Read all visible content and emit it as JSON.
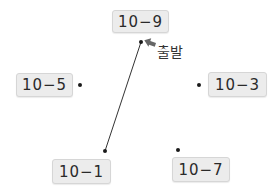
{
  "diagram": {
    "start_label": "출발",
    "nodes": [
      {
        "id": "n9",
        "label": "10−9",
        "box": {
          "x": 112,
          "y": 10,
          "w": 57,
          "h": 23
        },
        "dot": {
          "x": 141,
          "y": 42
        }
      },
      {
        "id": "n5",
        "label": "10−5",
        "box": {
          "x": 16,
          "y": 73,
          "w": 57,
          "h": 24
        },
        "dot": {
          "x": 80,
          "y": 85
        }
      },
      {
        "id": "n3",
        "label": "10−3",
        "box": {
          "x": 208,
          "y": 72,
          "w": 59,
          "h": 25
        },
        "dot": {
          "x": 199,
          "y": 85
        }
      },
      {
        "id": "n1",
        "label": "10−1",
        "box": {
          "x": 52,
          "y": 159,
          "w": 59,
          "h": 25
        },
        "dot": {
          "x": 105,
          "y": 151
        }
      },
      {
        "id": "n7",
        "label": "10−7",
        "box": {
          "x": 172,
          "y": 157,
          "w": 58,
          "h": 25
        },
        "dot": {
          "x": 178,
          "y": 150
        }
      }
    ],
    "edges": [
      {
        "from": "n9",
        "to": "n1"
      }
    ],
    "colors": {
      "box_fill": "#ececec",
      "box_border": "#d6d6d6",
      "line": "#333333",
      "arrow": "#666666",
      "dot": "#1a1a1a"
    }
  }
}
